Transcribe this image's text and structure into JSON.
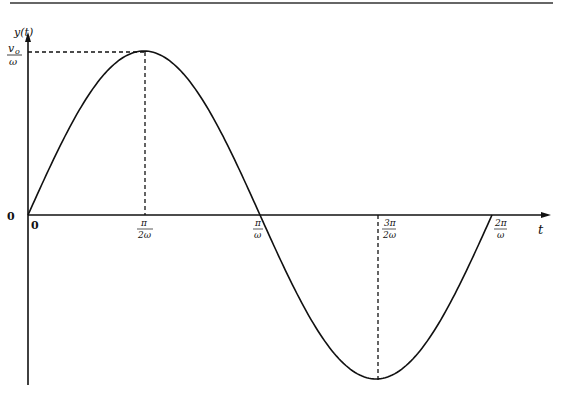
{
  "chart_data": {
    "type": "line",
    "title": "",
    "xlabel": "t",
    "ylabel": "y(t)",
    "function": "y(t) = (v0/ω) sin(ωt)",
    "x_ticks": [
      "0",
      "π/2ω",
      "π/ω",
      "3π/2ω",
      "2π/ω"
    ],
    "y_ticks": [
      "0",
      "v0/ω"
    ],
    "x": [
      0,
      0.25,
      0.5,
      0.75,
      1.0
    ],
    "x_units": "period fraction (t·ω/2π)",
    "y": [
      0,
      1,
      0,
      -1,
      0
    ],
    "y_units": "multiples of v0/ω",
    "annotations": [
      "dashed guide from peak to y-axis at v0/ω",
      "dashed vertical at π/2ω",
      "dashed vertical at 3π/2ω"
    ],
    "grid": false,
    "legend": null
  },
  "labels": {
    "y_axis": "y(t)",
    "x_axis": "t",
    "origin_y": "0",
    "origin_x": "0",
    "peak_num": "v",
    "peak_sub": "o",
    "peak_den": "ω",
    "t1_num": "π",
    "t1_den": "2ω",
    "t2_num": "π",
    "t2_den": "ω",
    "t3_num": "3π",
    "t3_den": "2ω",
    "t4_num": "2π",
    "t4_den": "ω"
  }
}
